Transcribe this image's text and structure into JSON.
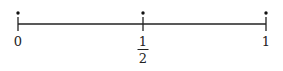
{
  "number_line": {
    "range": [
      0,
      1
    ],
    "line_color": "#222222",
    "points": [
      {
        "value": 0,
        "label": "0",
        "marked": true
      },
      {
        "value": 0.5,
        "label_numerator": "1",
        "label_denominator": "2",
        "marked": true
      },
      {
        "value": 1,
        "label": "1",
        "marked": true
      }
    ]
  }
}
